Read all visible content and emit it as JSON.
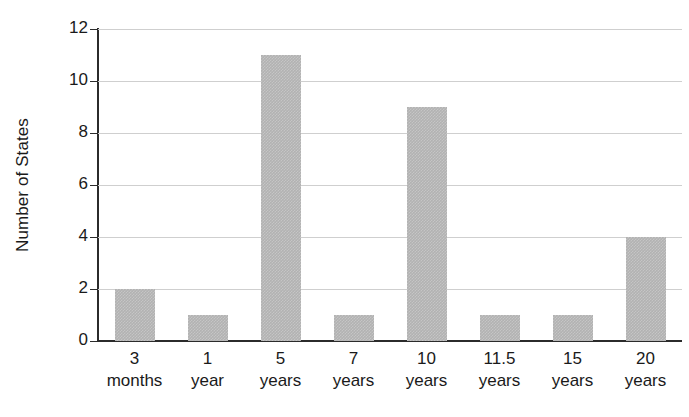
{
  "chart_data": {
    "type": "bar",
    "title": "",
    "subtitle": "",
    "xlabel": "",
    "ylabel": "Number of States",
    "categories": [
      "3 months",
      "1 year",
      "5 years",
      "7 years",
      "10 years",
      "11.5 years",
      "15 years",
      "20 years"
    ],
    "category_lines": [
      {
        "line1": "3",
        "line2": "months"
      },
      {
        "line1": "1",
        "line2": "year"
      },
      {
        "line1": "5",
        "line2": "years"
      },
      {
        "line1": "7",
        "line2": "years"
      },
      {
        "line1": "10",
        "line2": "years"
      },
      {
        "line1": "11.5",
        "line2": "years"
      },
      {
        "line1": "15",
        "line2": "years"
      },
      {
        "line1": "20",
        "line2": "years"
      }
    ],
    "values": [
      2,
      1,
      11,
      1,
      9,
      1,
      1,
      4
    ],
    "ylim": [
      0,
      12
    ],
    "ytick_labels": [
      "0",
      "2",
      "4",
      "6",
      "8",
      "10",
      "12"
    ],
    "ytick_values": [
      0,
      2,
      4,
      6,
      8,
      10,
      12
    ],
    "grid": true,
    "grid_axis": "y",
    "legend": false,
    "legend_position": "none",
    "bar_color": "#b2b2b2",
    "axis_color": "#2b2b2b",
    "grid_color": "#cfcfcf",
    "background_color": "#ffffff"
  }
}
